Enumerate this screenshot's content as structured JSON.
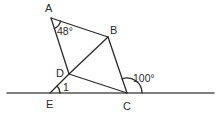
{
  "figure": {
    "type": "geometry",
    "points": {
      "A": {
        "label": "A",
        "x": 51,
        "y": 18
      },
      "B": {
        "label": "B",
        "x": 108,
        "y": 37
      },
      "C": {
        "label": "C",
        "x": 127,
        "y": 93
      },
      "D": {
        "label": "D",
        "x": 69,
        "y": 74
      },
      "E": {
        "label": "E",
        "x": 50,
        "y": 93
      }
    },
    "segments": [
      [
        "A",
        "B"
      ],
      [
        "A",
        "D"
      ],
      [
        "D",
        "E"
      ],
      [
        "D",
        "B"
      ],
      [
        "B",
        "C"
      ],
      [
        "D",
        "C"
      ]
    ],
    "baseline": {
      "x1": 7,
      "x2": 214,
      "y": 93
    },
    "angles": {
      "angle_A": {
        "text": "48°",
        "vertex": "A"
      },
      "angle_C_exterior": {
        "text": "100°",
        "vertex": "C"
      },
      "angle_1": {
        "text": "1",
        "vertex": "E"
      }
    },
    "colors": {
      "stroke": "#2b2b2b",
      "baseline": "#555555",
      "background": "#ffffff"
    }
  }
}
